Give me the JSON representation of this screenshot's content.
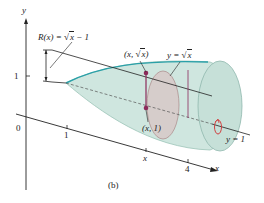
{
  "figure": {
    "caption": "(b)",
    "axes": {
      "y_label": "y",
      "x_label": "x",
      "origin_label": "0",
      "y_tick_1": "1",
      "x_tick_1": "1",
      "x_tick_x": "x",
      "x_tick_4": "4"
    },
    "annotations": {
      "radius_label_lhs": "R(x) =",
      "radius_label_sqrt": "x",
      "radius_label_tail": "− 1",
      "point_top_prefix": "(x,",
      "point_top_sqrt": "x",
      "point_top_suffix": ")",
      "curve_label_prefix": "y =",
      "curve_label_sqrt": "x",
      "point_bottom": "(x, 1)",
      "axis_of_rotation": "y = 1"
    },
    "colors": {
      "solid_fill": "#cfe6df",
      "solid_edge": "#8fb8ad",
      "curve": "#2aa0a8",
      "slice_fill": "#d8c4c4",
      "radius_segment": "#8b2a5a",
      "rotation_arrow": "#d04040",
      "axis": "#222222"
    }
  }
}
